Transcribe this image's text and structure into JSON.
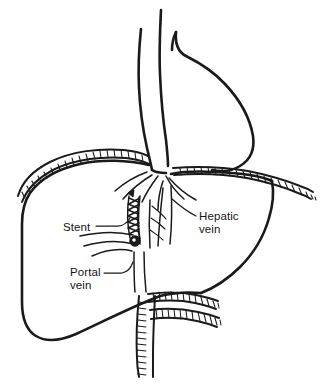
{
  "figure": {
    "style": "black-and-white line drawing",
    "background_color": "#ffffff",
    "ink_color": "#1a1a1a"
  },
  "labels": [
    {
      "id": "stent",
      "text": "Stent",
      "lines": [
        "Stent"
      ],
      "x": 63,
      "y": 228,
      "anchor": "start",
      "leader": "line from right of text up-right to stent mesh"
    },
    {
      "id": "hepatic-vein",
      "text": "Hepatic vein",
      "lines": [
        "Hepatic",
        "vein"
      ],
      "x": 199,
      "y": 222,
      "anchor": "start",
      "leader": "line from left of text up-left to hepatic vein branches"
    },
    {
      "id": "portal-vein",
      "text": "Portal vein",
      "lines": [
        "Portal",
        "vein"
      ],
      "x": 70,
      "y": 277,
      "anchor": "start",
      "leader": "line from right of text up-right to portal vein trunk"
    }
  ],
  "structures": [
    {
      "id": "liver",
      "name": "Liver"
    },
    {
      "id": "diaphragm",
      "name": "Diaphragm"
    },
    {
      "id": "heart",
      "name": "Heart"
    },
    {
      "id": "inferior-vena-cava",
      "name": "Inferior vena cava"
    },
    {
      "id": "hepatic-vein",
      "name": "Hepatic vein"
    },
    {
      "id": "portal-vein",
      "name": "Portal vein"
    },
    {
      "id": "stent",
      "name": "Stent"
    }
  ]
}
